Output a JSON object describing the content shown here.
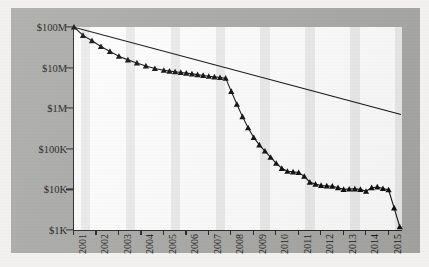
{
  "figure": {
    "panel_background": "#a9a9a7",
    "plot_background": "#ffffff",
    "band_color": "#ececec",
    "ink_color": "#111111"
  },
  "chart_data": {
    "type": "line",
    "title": "",
    "xlabel": "",
    "ylabel": "",
    "yscale": "log",
    "ylim": [
      1000,
      100000000
    ],
    "xlim": [
      2001,
      2015.6
    ],
    "grid": false,
    "legend": null,
    "y_tick_labels": [
      "$100M",
      "$10M",
      "$1M",
      "$100K",
      "$10K",
      "$1K"
    ],
    "y_tick_values": [
      100000000,
      10000000,
      1000000,
      100000,
      10000,
      1000
    ],
    "x_tick_labels": [
      "2001",
      "2002",
      "2003",
      "2004",
      "2005",
      "2006",
      "2007",
      "2008",
      "2009",
      "2010",
      "2011",
      "2012",
      "2013",
      "2014",
      "2015"
    ],
    "x_tick_values": [
      2001,
      2002,
      2003,
      2004,
      2005,
      2006,
      2007,
      2008,
      2009,
      2010,
      2011,
      2012,
      2013,
      2014,
      2015
    ],
    "series": [
      {
        "name": "data",
        "marker": "triangle",
        "x": [
          2001.0,
          2001.4,
          2001.8,
          2002.2,
          2002.6,
          2003.0,
          2003.4,
          2003.8,
          2004.2,
          2004.6,
          2005.0,
          2005.25,
          2005.5,
          2005.75,
          2006.0,
          2006.25,
          2006.5,
          2006.75,
          2007.0,
          2007.25,
          2007.5,
          2007.75,
          2008.0,
          2008.25,
          2008.5,
          2008.75,
          2009.0,
          2009.25,
          2009.5,
          2009.75,
          2010.0,
          2010.25,
          2010.5,
          2010.75,
          2011.0,
          2011.25,
          2011.5,
          2011.75,
          2012.0,
          2012.25,
          2012.5,
          2012.75,
          2013.0,
          2013.25,
          2013.5,
          2013.75,
          2014.0,
          2014.25,
          2014.5,
          2014.75,
          2015.0,
          2015.25,
          2015.5
        ],
        "y": [
          100000000,
          62000000,
          46000000,
          33000000,
          25000000,
          19000000,
          15500000,
          13000000,
          11000000,
          9500000,
          8600000,
          8200000,
          7900000,
          7600000,
          7300000,
          7000000,
          6700000,
          6400000,
          6100000,
          5900000,
          5700000,
          5500000,
          2600000,
          1250000,
          620000,
          330000,
          190000,
          125000,
          88000,
          62000,
          44000,
          33000,
          28000,
          27000,
          26000,
          21000,
          15000,
          13500,
          12500,
          12200,
          12000,
          11000,
          10000,
          10200,
          10300,
          10000,
          9000,
          11000,
          11500,
          10500,
          9800,
          3500,
          1200
        ],
        "y_description": "dollar value on log scale declining from $100M in 2001 to about $1K in mid-2015"
      },
      {
        "name": "trend",
        "marker": "none",
        "x": [
          2001.0,
          2015.6
        ],
        "y": [
          100000000,
          700000
        ],
        "y_description": "straight reference line on log axis from $100M at 2001 to about $700K at 2015.6"
      }
    ]
  }
}
